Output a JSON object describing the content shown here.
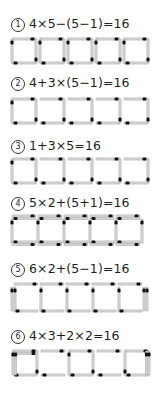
{
  "puzzles": [
    {
      "number": "1",
      "equation": "4×5−(5−1)=16",
      "figure": "five-separate-squares"
    },
    {
      "number": "2",
      "equation": "4+3×(5−1)=16",
      "figure": "one-square-plus-four-open-squares"
    },
    {
      "number": "3",
      "equation": "1+3×5=16",
      "figure": "one-square-plus-four-open-squares-alt"
    },
    {
      "number": "4",
      "equation": "5×2+(5+1)=16",
      "figure": "five-joined-squares-double-rails"
    },
    {
      "number": "5",
      "equation": "6×2+(5−1)=16",
      "figure": "five-joined-cells-rails"
    },
    {
      "number": "6",
      "equation": "4×3+2×2=16",
      "figure": "three-squares-with-two-gap-pairs"
    }
  ],
  "colors": {
    "stick": "#c8c8c8",
    "stick_edge": "#9a9a9a",
    "head": "#111111",
    "text": "#1e1e1e"
  }
}
